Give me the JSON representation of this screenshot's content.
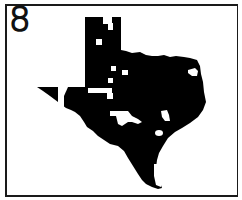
{
  "panel": {
    "number_label": "8"
  },
  "map": {
    "region": "Texas",
    "fill_color": "#000000",
    "highlight_color": "#ffffff",
    "border_color": "#1a1a1a",
    "highlighted_areas_count": 16
  }
}
